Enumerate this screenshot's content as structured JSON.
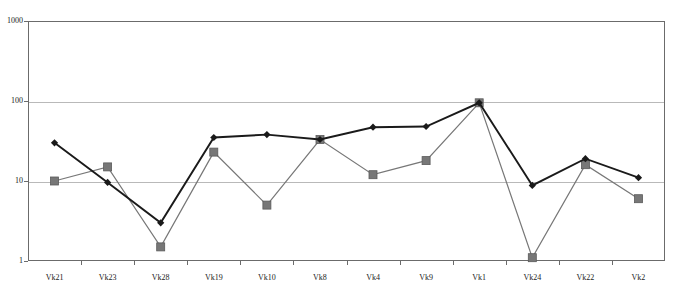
{
  "chart_data": {
    "type": "line",
    "title": "",
    "subtitle": "",
    "xlabel": "",
    "ylabel": "",
    "yscale": "log",
    "ylim": [
      1,
      1000
    ],
    "ytick_labels": [
      "1000",
      "100",
      "10",
      "1"
    ],
    "ytick_values": [
      1000,
      100,
      10,
      1
    ],
    "grid": true,
    "gridlines_at": [
      100,
      10
    ],
    "legend": "none",
    "categories": [
      "Vk21",
      "Vk23",
      "Vk28",
      "Vk19",
      "Vk10",
      "Vk8",
      "Vk4",
      "Vk9",
      "Vk1",
      "Vk24",
      "Vk22",
      "Vk2"
    ],
    "series": [
      {
        "name": "series-dark",
        "marker": "diamond",
        "color": "#1a1a1a",
        "values": [
          30,
          9.6,
          3.0,
          35,
          38,
          33,
          47,
          48,
          95,
          8.8,
          19,
          11
        ]
      },
      {
        "name": "series-gray",
        "marker": "square",
        "color": "#777777",
        "values": [
          10,
          15,
          1.5,
          23,
          5.0,
          33,
          12,
          18,
          95,
          1.1,
          16,
          6.0
        ]
      }
    ]
  },
  "axes": {
    "y_axis_name": "y-axis-log",
    "x_axis_name": "x-axis-categories"
  }
}
